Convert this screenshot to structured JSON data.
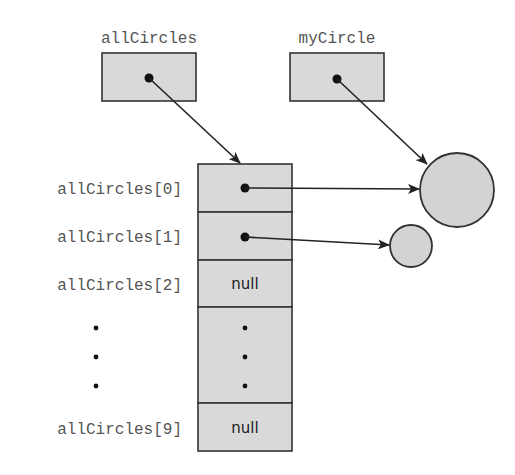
{
  "diagram": {
    "variables": [
      {
        "id": "allCircles",
        "label": "allCircles",
        "points_to": "array"
      },
      {
        "id": "myCircle",
        "label": "myCircle",
        "points_to": "circle_large"
      }
    ],
    "array": {
      "name": "allCircles",
      "length": 10,
      "rows": [
        {
          "label": "allCircles[0]",
          "value": "reference",
          "points_to": "circle_large"
        },
        {
          "label": "allCircles[1]",
          "value": "reference",
          "points_to": "circle_small"
        },
        {
          "label": "allCircles[2]",
          "value": "null"
        },
        {
          "label": "⋮",
          "value": "⋮",
          "ellipsis": true
        },
        {
          "label": "allCircles[9]",
          "value": "null"
        }
      ]
    },
    "objects": [
      {
        "id": "circle_large",
        "shape": "circle",
        "size": "large"
      },
      {
        "id": "circle_small",
        "shape": "circle",
        "size": "small"
      }
    ],
    "labels": {
      "allCircles": "allCircles",
      "myCircle": "myCircle",
      "row0": "allCircles[0]",
      "row1": "allCircles[1]",
      "row2": "allCircles[2]",
      "row9": "allCircles[9]",
      "null2": "null",
      "null9": "null"
    },
    "colors": {
      "box_fill": "#d9d9d9",
      "stroke": "#333333",
      "label_text": "#555555"
    }
  }
}
